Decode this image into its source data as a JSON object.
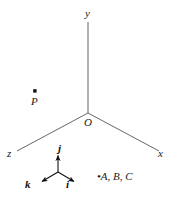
{
  "figure": {
    "background_color": "#ffffff",
    "line_color": "#555555",
    "text_color": "#1a1a1a",
    "width": 171,
    "height": 198
  },
  "axes": {
    "origin_label": "O",
    "y_label": "y",
    "x_label": "x",
    "z_label": "z",
    "origin_point": {
      "x": 88,
      "y": 113
    },
    "y_end": {
      "x": 88,
      "y": 22
    },
    "x_end": {
      "x": 159,
      "y": 151
    },
    "z_end": {
      "x": 17,
      "y": 151
    }
  },
  "points": {
    "P": {
      "label": "P",
      "marker": "dot-marker",
      "dot": {
        "x": 35,
        "y": 91
      }
    },
    "group": {
      "label": "A, B, C",
      "bullet": "•",
      "marker": "dot-marker",
      "dot": {
        "x": 94,
        "y": 177
      }
    }
  },
  "unit_vectors": {
    "origin": {
      "x": 58,
      "y": 172
    },
    "items": [
      {
        "name": "j",
        "label": "j",
        "direction": "up",
        "tip": {
          "x": 58,
          "y": 154
        }
      },
      {
        "name": "i",
        "label": "i",
        "direction": "down-right",
        "tip": {
          "x": 76,
          "y": 183
        }
      },
      {
        "name": "k",
        "label": "k",
        "direction": "down-left",
        "tip": {
          "x": 40,
          "y": 183
        }
      }
    ]
  }
}
